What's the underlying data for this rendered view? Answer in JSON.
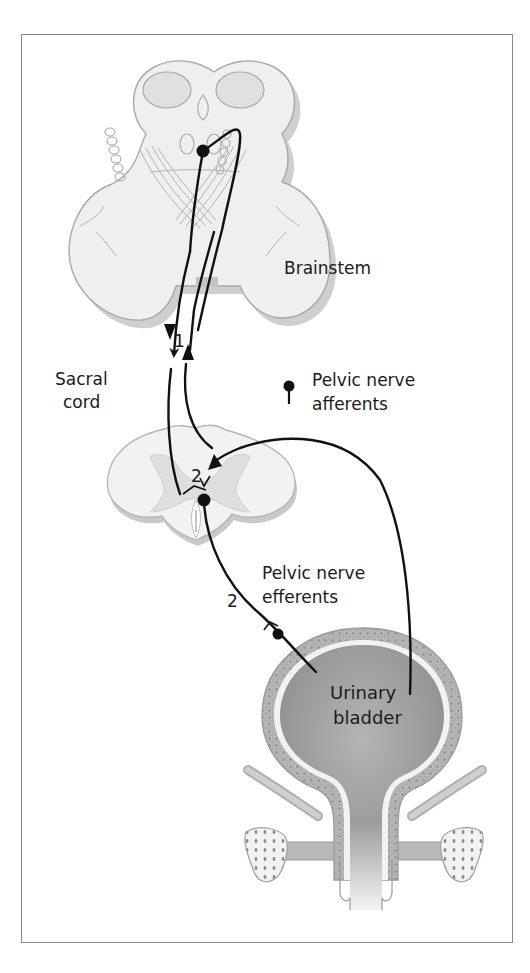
{
  "figure": {
    "type": "neuroanatomy-diagram"
  },
  "labels": {
    "brainstem": "Brainstem",
    "sacral_cord_line1": "Sacral",
    "sacral_cord_line2": "cord",
    "pelvic_afferents_line1": "Pelvic nerve",
    "pelvic_afferents_line2": "afferents",
    "pelvic_efferents_line1": "Pelvic nerve",
    "pelvic_efferents_line2": "efferents",
    "bladder_line1": "Urinary",
    "bladder_line2": "bladder"
  },
  "pathway_numbers": {
    "spinobulbospinal": "1",
    "sacral_synapse": "2",
    "efferent": "2"
  },
  "colors": {
    "frame": "#8a8a8a",
    "tissue_light": "#ececec",
    "tissue_outline": "#a8a8a8",
    "tissue_shadow": "#c4c4c4",
    "grey_matter": "#dcdcdc",
    "bladder_fill": "#9e9e9e",
    "bladder_wall": "#b8b8b8",
    "nerve": "#111111"
  }
}
